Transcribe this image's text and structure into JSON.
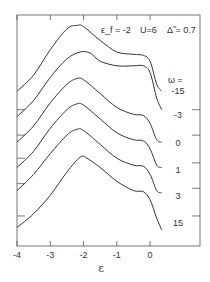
{
  "chart_data": {
    "type": "line",
    "title": "",
    "annotation": {
      "eps_f": "ε_f = -2",
      "U": "U=6",
      "delta": "Δ̃ = 0.7"
    },
    "xlabel": "ε",
    "ylabel": "",
    "xlim": [
      -4,
      1.5
    ],
    "x_ticks": [
      -4,
      -3,
      -2,
      -1,
      0
    ],
    "x_tick_labels": [
      "-4",
      "-3",
      "-2",
      "-1",
      "0"
    ],
    "grid": false,
    "legend_title": "ω =",
    "note": "Curves are vertically offset spectra (arbitrary units); y values are in relative plot units (0 = bottom, 100 = top).",
    "series": [
      {
        "name": "-15",
        "x": [
          -4.0,
          -3.5,
          -3.0,
          -2.5,
          -2.2,
          -2.0,
          -1.5,
          -1.0,
          -0.5,
          -0.2,
          0.0,
          0.2,
          0.35
        ],
        "y": [
          67,
          74,
          85,
          94,
          95.5,
          95,
          89,
          84,
          83,
          82.5,
          80,
          70,
          67
        ]
      },
      {
        "name": "-3",
        "x": [
          -4.0,
          -3.5,
          -3.0,
          -2.5,
          -2.1,
          -1.8,
          -1.5,
          -1.0,
          -0.5,
          -0.2,
          0.0,
          0.2,
          0.35
        ],
        "y": [
          56,
          63,
          73,
          81,
          84,
          83.5,
          80,
          78,
          78,
          78,
          75,
          64,
          59
        ]
      },
      {
        "name": "0",
        "x": [
          -4.0,
          -3.5,
          -3.0,
          -2.5,
          -2.2,
          -2.0,
          -1.5,
          -1.0,
          -0.5,
          -0.2,
          0.0,
          0.2,
          0.35
        ],
        "y": [
          45,
          52,
          62,
          70,
          72.5,
          72,
          66,
          60,
          57,
          56.5,
          53,
          46,
          45
        ]
      },
      {
        "name": "1",
        "x": [
          -4.0,
          -3.5,
          -3.0,
          -2.5,
          -2.2,
          -2.0,
          -1.5,
          -1.0,
          -0.5,
          -0.2,
          0.0,
          0.2,
          0.35
        ],
        "y": [
          34,
          41,
          51,
          59,
          61.5,
          61,
          55,
          49,
          46,
          45.5,
          42,
          35,
          34
        ]
      },
      {
        "name": "3",
        "x": [
          -4.0,
          -3.5,
          -3.0,
          -2.5,
          -2.2,
          -2.0,
          -1.5,
          -1.0,
          -0.5,
          -0.2,
          0.0,
          0.2,
          0.35
        ],
        "y": [
          24,
          31,
          40,
          48,
          50.5,
          50,
          44,
          38,
          35,
          34.5,
          31,
          24,
          23
        ]
      },
      {
        "name": "15",
        "x": [
          -4.0,
          -3.5,
          -3.0,
          -2.5,
          -2.1,
          -1.9,
          -1.5,
          -1.0,
          -0.5,
          -0.2,
          0.0,
          0.2,
          0.35
        ],
        "y": [
          8,
          14,
          22,
          32,
          38.5,
          38,
          34,
          28,
          24,
          23.5,
          20,
          12,
          7
        ]
      }
    ],
    "series_labels": [
      "-15",
      "-3",
      "0",
      "1",
      "3",
      "15"
    ],
    "left_tick_y": [
      59,
      48,
      38,
      27,
      13
    ],
    "right_tick_y": [
      59,
      48,
      36,
      25,
      13
    ]
  }
}
